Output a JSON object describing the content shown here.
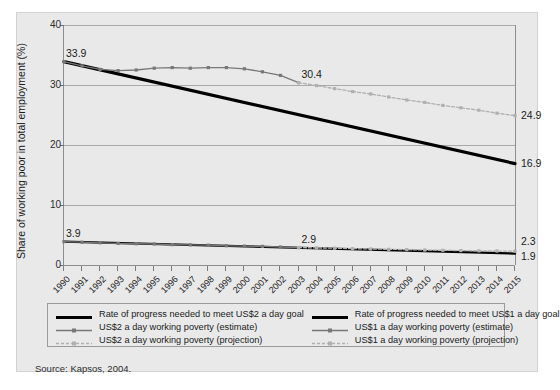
{
  "figure": {
    "source_note": "Source: Kapsos, 2004.",
    "background_color": "#e9e9e9",
    "partial_title_top": ""
  },
  "chart_data": {
    "type": "line",
    "title": "",
    "xlabel": "",
    "ylabel": "Share of working poor in total employment (%)",
    "ylim": [
      0,
      40
    ],
    "yticks": [
      "0",
      "10",
      "20",
      "30",
      "40"
    ],
    "grid": true,
    "legend_position": "below-plot",
    "x": [
      "1990",
      "1991",
      "1992",
      "1993",
      "1994",
      "1995",
      "1996",
      "1997",
      "1998",
      "1999",
      "2000",
      "2001",
      "2002",
      "2003",
      "2004",
      "2005",
      "2006",
      "2007",
      "2008",
      "2009",
      "2010",
      "2011",
      "2012",
      "2013",
      "2014",
      "2015"
    ],
    "series": [
      {
        "name": "Rate of progress needed to meet US$2 a day goal",
        "style": "thick-black-line",
        "color": "#000000",
        "x": [
          "1990",
          "2015"
        ],
        "values": [
          33.9,
          16.9
        ]
      },
      {
        "name": "US$2 a day working poverty (estimate)",
        "style": "dark-gray-line-with-markers",
        "color": "#787878",
        "x": [
          "1990",
          "1991",
          "1992",
          "1993",
          "1994",
          "1995",
          "1996",
          "1997",
          "1998",
          "1999",
          "2000",
          "2001",
          "2002",
          "2003"
        ],
        "values": [
          33.9,
          33.2,
          32.6,
          32.4,
          32.5,
          32.8,
          32.9,
          32.8,
          32.9,
          32.9,
          32.7,
          32.2,
          31.6,
          30.4
        ]
      },
      {
        "name": "US$2 a day working poverty (projection)",
        "style": "light-gray-line-with-markers",
        "color": "#b0b0b0",
        "x": [
          "2003",
          "2004",
          "2005",
          "2006",
          "2007",
          "2008",
          "2009",
          "2010",
          "2011",
          "2012",
          "2013",
          "2014",
          "2015"
        ],
        "values": [
          30.4,
          29.9,
          29.4,
          28.9,
          28.5,
          28.0,
          27.5,
          27.1,
          26.6,
          26.2,
          25.8,
          25.3,
          24.9
        ]
      },
      {
        "name": "Rate of progress needed to meet US$1 a day goal",
        "style": "thick-black-line",
        "color": "#000000",
        "x": [
          "1990",
          "2015"
        ],
        "values": [
          3.9,
          1.9
        ]
      },
      {
        "name": "US$1 a day working poverty (estimate)",
        "style": "dark-gray-line-with-markers",
        "color": "#787878",
        "x": [
          "1990",
          "1991",
          "1992",
          "1993",
          "1994",
          "1995",
          "1996",
          "1997",
          "1998",
          "1999",
          "2000",
          "2001",
          "2002",
          "2003"
        ],
        "values": [
          3.9,
          3.8,
          3.7,
          3.6,
          3.55,
          3.5,
          3.4,
          3.35,
          3.3,
          3.2,
          3.15,
          3.1,
          3.0,
          2.9
        ]
      },
      {
        "name": "US$1 a day working poverty (projection)",
        "style": "light-gray-line-with-markers",
        "color": "#b0b0b0",
        "x": [
          "2003",
          "2004",
          "2005",
          "2006",
          "2007",
          "2008",
          "2009",
          "2010",
          "2011",
          "2012",
          "2013",
          "2014",
          "2015"
        ],
        "values": [
          2.9,
          2.85,
          2.8,
          2.73,
          2.67,
          2.61,
          2.56,
          2.5,
          2.45,
          2.4,
          2.36,
          2.33,
          2.3
        ]
      }
    ],
    "annotations": [
      {
        "label": "33.9",
        "x": "1990",
        "y": 33.9,
        "position": "left-top"
      },
      {
        "label": "3.9",
        "x": "1990",
        "y": 3.9,
        "position": "left-top"
      },
      {
        "label": "30.4",
        "x": "2003",
        "y": 30.4,
        "position": "above"
      },
      {
        "label": "2.9",
        "x": "2003",
        "y": 2.9,
        "position": "above"
      },
      {
        "label": "24.9",
        "x": "2015",
        "y": 24.9,
        "position": "right"
      },
      {
        "label": "16.9",
        "x": "2015",
        "y": 16.9,
        "position": "right"
      },
      {
        "label": "2.3",
        "x": "2015",
        "y": 2.3,
        "position": "right-above"
      },
      {
        "label": "1.9",
        "x": "2015",
        "y": 1.9,
        "position": "right-below"
      }
    ]
  },
  "legend": {
    "columns": [
      {
        "entries": [
          {
            "label": "Rate of progress needed to meet US$2 a day goal",
            "key": "thick-black-line"
          },
          {
            "label": "US$2 a day working poverty (estimate)",
            "key": "dark-gray-line-with-markers"
          },
          {
            "label": "US$2 a day working poverty (projection)",
            "key": "light-gray-line-with-markers"
          }
        ]
      },
      {
        "entries": [
          {
            "label": "Rate of progress needed to meet US$1 a day goal",
            "key": "thick-black-line"
          },
          {
            "label": "US$1 a day working poverty (estimate)",
            "key": "dark-gray-line-with-markers"
          },
          {
            "label": "US$1 a day working poverty (projection)",
            "key": "light-gray-line-with-markers"
          }
        ]
      }
    ]
  }
}
